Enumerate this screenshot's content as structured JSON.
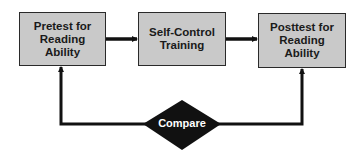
{
  "diagram": {
    "nodes": [
      {
        "id": "pretest",
        "lines": [
          "Pretest for",
          "Reading",
          "Ability"
        ]
      },
      {
        "id": "training",
        "lines": [
          "Self-Control",
          "Training"
        ]
      },
      {
        "id": "posttest",
        "lines": [
          "Posttest for",
          "Reading",
          "Ability"
        ]
      }
    ],
    "compare": {
      "label": "Compare"
    },
    "edges": [
      {
        "from": "pretest",
        "to": "training"
      },
      {
        "from": "training",
        "to": "posttest"
      },
      {
        "from": "compare",
        "to": "pretest"
      },
      {
        "from": "compare",
        "to": "posttest"
      }
    ],
    "colors": {
      "box_fill": "#c9c9c9",
      "line": "#111111",
      "diamond": "#111111"
    }
  }
}
